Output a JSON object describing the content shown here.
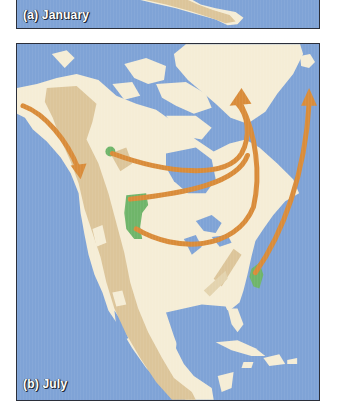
{
  "figure": {
    "panels": [
      {
        "id": "a",
        "label": "(a) January"
      },
      {
        "id": "b",
        "label": "(b) July"
      }
    ]
  },
  "legend_colors": {
    "ocean": "#7fa3d6",
    "land": "#f5edd6",
    "highlight_range": "#dcc59a",
    "breeding_area": "#6fb56a",
    "migration_arrow": "#d98c3a"
  },
  "map": {
    "region": "North America",
    "migration_routes": [
      {
        "from": "Alaska coast",
        "to": "Pacific Northwest",
        "direction": "south"
      },
      {
        "from": "Northern Rockies (small green)",
        "to": "Baffin Bay / Greenland",
        "direction": "northeast"
      },
      {
        "from": "Central Rockies (large green)",
        "to": "Baffin Bay / Greenland",
        "direction": "northeast"
      },
      {
        "from": "Central Rockies (large green, south)",
        "to": "Baffin Bay / Greenland",
        "direction": "northeast"
      },
      {
        "from": "Mid-Atlantic coast (green)",
        "to": "Greenland east",
        "direction": "north"
      }
    ]
  }
}
